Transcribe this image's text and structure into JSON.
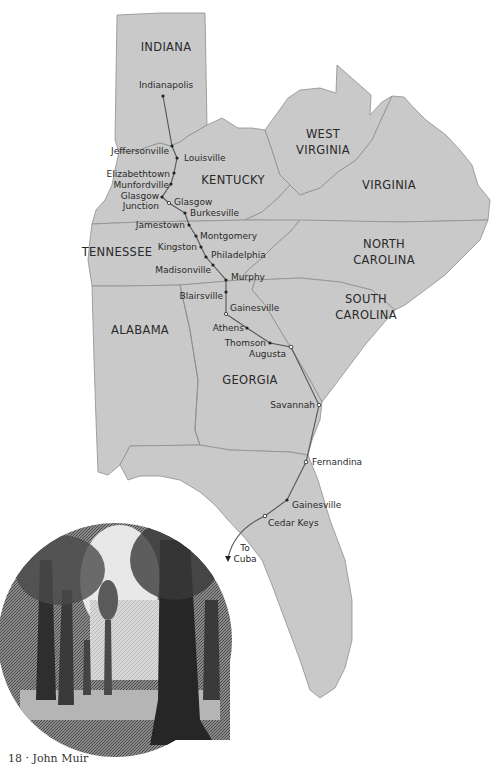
{
  "map": {
    "fill_color": "#c9c9c9",
    "border_color": "#8e8e8e",
    "route_color": "#555555",
    "background": "#ffffff",
    "states": [
      {
        "name": "INDIANA",
        "x": 166,
        "y": 51
      },
      {
        "name": "KENTUCKY",
        "x": 233,
        "y": 184
      },
      {
        "name": "WEST",
        "x": 323,
        "y": 138
      },
      {
        "name": "VIRGINIA",
        "x": 323,
        "y": 154
      },
      {
        "name": "VIRGINIA",
        "x": 389,
        "y": 189
      },
      {
        "name": "TENNESSEE",
        "x": 117,
        "y": 256
      },
      {
        "name": "NORTH",
        "x": 384,
        "y": 248
      },
      {
        "name": "CAROLINA",
        "x": 384,
        "y": 264
      },
      {
        "name": "SOUTH",
        "x": 366,
        "y": 303
      },
      {
        "name": "CAROLINA",
        "x": 366,
        "y": 319
      },
      {
        "name": "ALABAMA",
        "x": 140,
        "y": 334
      },
      {
        "name": "GEORGIA",
        "x": 250,
        "y": 384
      }
    ],
    "cities": [
      {
        "name": "Indianapolis",
        "x": 163,
        "y": 96,
        "lx": 166,
        "ly": 88,
        "anchor": "middle"
      },
      {
        "name": "Jeffersonville",
        "x": 172,
        "y": 146,
        "lx": 169,
        "ly": 154,
        "anchor": "end"
      },
      {
        "name": "Louisville",
        "x": 177,
        "y": 158,
        "lx": 184,
        "ly": 161,
        "anchor": "start"
      },
      {
        "name": "Elizabethtown",
        "x": 174,
        "y": 173,
        "lx": 170,
        "ly": 177,
        "anchor": "end"
      },
      {
        "name": "Munfordville",
        "x": 171,
        "y": 184,
        "lx": 169,
        "ly": 188,
        "anchor": "end"
      },
      {
        "name": "Glasgow",
        "x": 162,
        "y": 197,
        "lx": 159,
        "ly": 199,
        "anchor": "end"
      },
      {
        "name": "Junction",
        "x": null,
        "y": null,
        "lx": 159,
        "ly": 209,
        "anchor": "end"
      },
      {
        "name": "Glasgow",
        "x": 169,
        "y": 203,
        "lx": 174,
        "ly": 205,
        "anchor": "start"
      },
      {
        "name": "Burkesville",
        "x": 185,
        "y": 213,
        "lx": 190,
        "ly": 216,
        "anchor": "start"
      },
      {
        "name": "Jamestown",
        "x": 189,
        "y": 225,
        "lx": 185,
        "ly": 228,
        "anchor": "end"
      },
      {
        "name": "Montgomery",
        "x": 196,
        "y": 236,
        "lx": 200,
        "ly": 239,
        "anchor": "start"
      },
      {
        "name": "Kingston",
        "x": 201,
        "y": 247,
        "lx": 197,
        "ly": 250,
        "anchor": "end"
      },
      {
        "name": "Philadelphia",
        "x": 206,
        "y": 257,
        "lx": 211,
        "ly": 258,
        "anchor": "start"
      },
      {
        "name": "Madisonville",
        "x": 213,
        "y": 265,
        "lx": 211,
        "ly": 273,
        "anchor": "end"
      },
      {
        "name": "Murphy",
        "x": 226,
        "y": 280,
        "lx": 231,
        "ly": 280,
        "anchor": "start"
      },
      {
        "name": "Blairsville",
        "x": 226,
        "y": 292,
        "lx": 223,
        "ly": 299,
        "anchor": "end"
      },
      {
        "name": "Gainesville",
        "x": 226,
        "y": 314,
        "lx": 230,
        "ly": 311,
        "anchor": "start"
      },
      {
        "name": "Athens",
        "x": 247,
        "y": 328,
        "lx": 244,
        "ly": 331,
        "anchor": "end"
      },
      {
        "name": "Thomson",
        "x": 270,
        "y": 343,
        "lx": 266,
        "ly": 346,
        "anchor": "end"
      },
      {
        "name": "Augusta",
        "x": 291,
        "y": 347,
        "lx": 286,
        "ly": 357,
        "anchor": "end"
      },
      {
        "name": "Savannah",
        "x": 319,
        "y": 405,
        "lx": 315,
        "ly": 408,
        "anchor": "end"
      },
      {
        "name": "Fernandina",
        "x": 306,
        "y": 462,
        "lx": 312,
        "ly": 465,
        "anchor": "start"
      },
      {
        "name": "Gainesville",
        "x": 287,
        "y": 500,
        "lx": 292,
        "ly": 508,
        "anchor": "start"
      },
      {
        "name": "Cedar Keys",
        "x": 265,
        "y": 516,
        "lx": 268,
        "ly": 526,
        "anchor": "start"
      }
    ],
    "to_cuba": {
      "line1": "To",
      "line2": "Cuba"
    }
  },
  "illustration": {
    "description": "engraving-of-forest-trees"
  },
  "caption": "18 · John Muir"
}
